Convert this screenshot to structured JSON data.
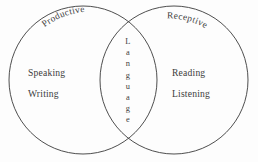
{
  "diagram": {
    "type": "venn-two-set",
    "background_color": "#fdfdfd",
    "stroke_color": "#3a3a3a",
    "text_color": "#3c3c3c",
    "left_set": {
      "label": "Productive",
      "items": [
        "Speaking",
        "Writing"
      ]
    },
    "right_set": {
      "label": "Receptive",
      "items": [
        "Reading",
        "Listening"
      ]
    },
    "intersection": {
      "label": "Language",
      "letters": [
        "L",
        "a",
        "n",
        "g",
        "u",
        "a",
        "g",
        "e"
      ],
      "orientation": "vertical-stacked"
    }
  }
}
